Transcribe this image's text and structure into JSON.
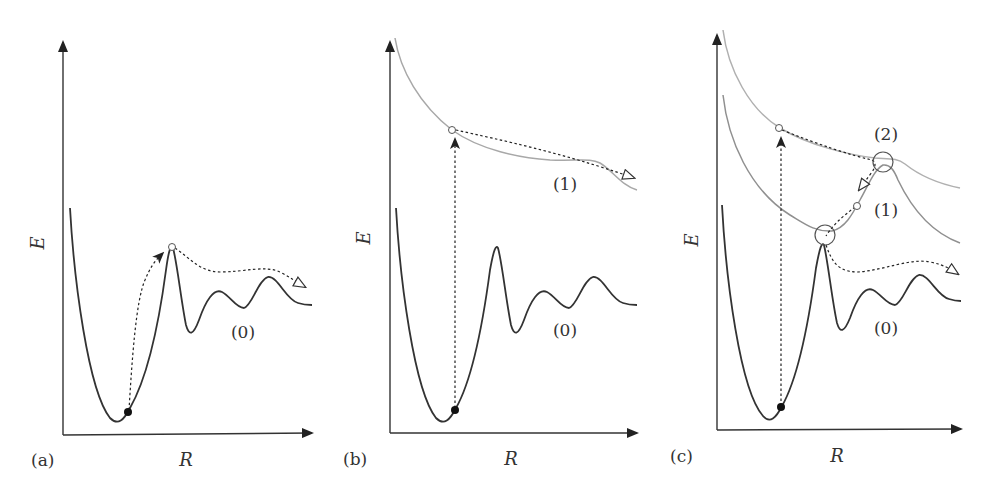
{
  "figure": {
    "panels": [
      {
        "id": "a",
        "label": "(a)",
        "x_axis_label": "R",
        "y_axis_label": "E",
        "curve_labels": [
          "(0)"
        ]
      },
      {
        "id": "b",
        "label": "(b)",
        "x_axis_label": "R",
        "y_axis_label": "E",
        "curve_labels": [
          "(1)",
          "(0)"
        ]
      },
      {
        "id": "c",
        "label": "(c)",
        "x_axis_label": "R",
        "y_axis_label": "E",
        "curve_labels": [
          "(2)",
          "(1)",
          "(0)"
        ]
      }
    ],
    "colors": {
      "ground_state": "#333333",
      "excited_state": "#a8a8a8",
      "arrow": "#222222",
      "background": "#ffffff"
    }
  }
}
